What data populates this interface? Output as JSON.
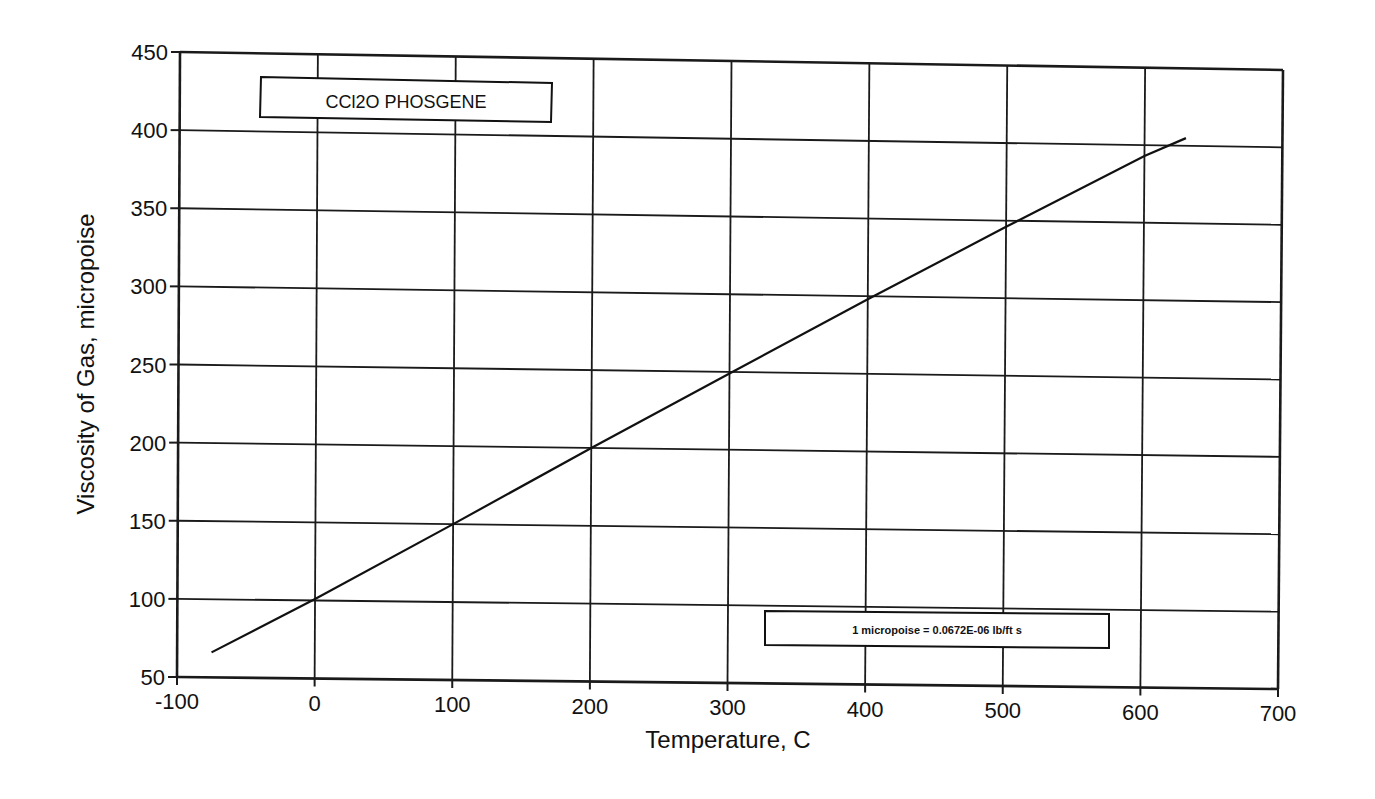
{
  "chart_data": {
    "type": "line",
    "title": "CCl2O PHOSGENE",
    "xlabel": "Temperature, C",
    "ylabel": "Viscosity of Gas, micropoise",
    "xlim": [
      -100,
      700
    ],
    "ylim": [
      50,
      450
    ],
    "x_ticks": [
      -100,
      0,
      100,
      200,
      300,
      400,
      500,
      600,
      700
    ],
    "y_ticks": [
      50,
      100,
      150,
      200,
      250,
      300,
      350,
      400,
      450
    ],
    "grid": true,
    "legend": null,
    "annotation": "1 micropoise = 0.0672E-06 lb/ft s",
    "series": [
      {
        "name": "CCl2O PHOSGENE",
        "x": [
          -75,
          0,
          100,
          200,
          300,
          400,
          500,
          600,
          630
        ],
        "y": [
          66,
          101,
          150,
          200,
          249,
          298,
          346,
          393,
          405
        ]
      }
    ]
  },
  "labels": {
    "title_box": "CCl2O  PHOSGENE",
    "note_box": "1 micropoise = 0.0672E-06 lb/ft s",
    "x_axis_title": "Temperature, C",
    "y_axis_title": "Viscosity of Gas, micropoise",
    "x_tick_labels": [
      "-100",
      "0",
      "100",
      "200",
      "300",
      "400",
      "500",
      "600",
      "700"
    ],
    "y_tick_labels": [
      "50",
      "100",
      "150",
      "200",
      "250",
      "300",
      "350",
      "400",
      "450"
    ]
  },
  "colors": {
    "line": "#111111",
    "grid": "#1a1a1a",
    "background": "#ffffff"
  }
}
